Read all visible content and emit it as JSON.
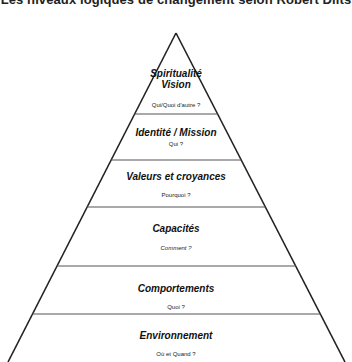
{
  "title": "Les niveaux logiques de changement selon Robert Dilts",
  "pyramid": {
    "apex": [
      176,
      33
    ],
    "base_left": [
      8,
      362
    ],
    "base_right": [
      345,
      362
    ],
    "stroke_color": "#222222",
    "divider_color": "#555555",
    "dividers_y": [
      114,
      160,
      207,
      266,
      314
    ]
  },
  "levels": [
    {
      "name": "Spiritualité",
      "name2": "Vision",
      "question": "Qui/Quoi d'autre ?"
    },
    {
      "name": "Identité / Mission",
      "question": "Qui ?"
    },
    {
      "name": "Valeurs et croyances",
      "question": "Pourquoi ?"
    },
    {
      "name": "Capacités",
      "question": "Comment ?"
    },
    {
      "name": "Comportements",
      "question": "Quoi ?"
    },
    {
      "name": "Environnement",
      "question": "Où et Quand ?"
    }
  ]
}
